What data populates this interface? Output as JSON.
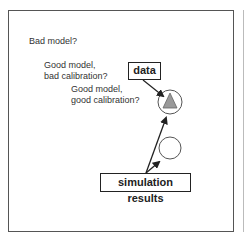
{
  "labels": {
    "bad_model": "Bad model?",
    "good_bad_calib": "Good model,\nbad calibration?",
    "good_good_calib": "Good model,\ngood calibration?"
  },
  "boxes": {
    "data": "data",
    "simulation": "simulation results"
  },
  "colors": {
    "triangle": "#999999",
    "stroke": "#222222"
  }
}
